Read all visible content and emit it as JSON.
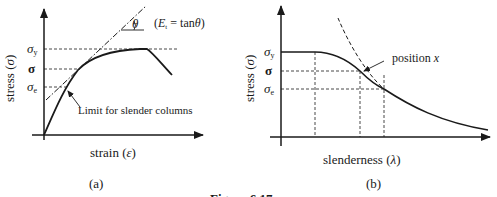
{
  "panel_a": {
    "caption": "(a)",
    "x_label": "strain (ε)",
    "y_label": "stress (σ)",
    "y_ticks": [
      "σy",
      "σ",
      "σe"
    ],
    "annotation_tangent": "(Et = tanθ)",
    "theta": "θ",
    "annotation_limit": "Limit for slender columns"
  },
  "panel_b": {
    "caption": "(b)",
    "x_label": "slenderness (λ)",
    "y_label": "stress (σ)",
    "y_ticks": [
      "σy",
      "σ",
      "σe"
    ],
    "annotation_position": "position x"
  },
  "figure_caption": "Figure 6.17",
  "colors": {
    "line": "#1a1a1a",
    "background": "#ffffff"
  }
}
